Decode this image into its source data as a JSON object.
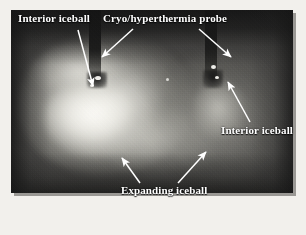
{
  "figure": {
    "type": "grayscale-photograph",
    "background_color": "#ffffff",
    "photo_background_color": "#3a3a38",
    "annotation_color": "#ffffff"
  },
  "annotations": {
    "interior_iceball_left": {
      "label": "Interior iceball",
      "arrow": {
        "from_x": 78,
        "from_y": 30,
        "to_x": 93,
        "to_y": 86
      }
    },
    "cryo_probe": {
      "label": "Cryo/hyperthermia probe",
      "arrow_left": {
        "from_x": 133,
        "from_y": 29,
        "to_x": 102,
        "to_y": 57
      },
      "arrow_right": {
        "from_x": 199,
        "from_y": 29,
        "to_x": 231,
        "to_y": 57
      }
    },
    "interior_iceball_right": {
      "label": "Interior iceball",
      "arrow": {
        "from_x": 250,
        "from_y": 122,
        "to_x": 228,
        "to_y": 82
      }
    },
    "expanding_iceball": {
      "label": "Expanding iceball",
      "arrow_left": {
        "from_x": 140,
        "from_y": 183,
        "to_x": 122,
        "to_y": 158
      },
      "arrow_right": {
        "from_x": 178,
        "from_y": 183,
        "to_x": 206,
        "to_y": 152
      }
    }
  },
  "features": {
    "iceball_left": "large bright iceball, left of center",
    "iceball_right": "dimmer iceball, right of center",
    "probe_left": "dark vertical probe shaft entering from top-left-center",
    "probe_right": "dark vertical probe shaft entering from top-right-center"
  }
}
